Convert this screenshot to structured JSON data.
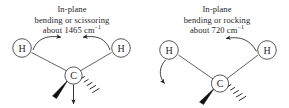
{
  "figure": {
    "background_color": "#ffffff",
    "stroke_color": "#1f1f1f",
    "panels": [
      {
        "id": "scissoring",
        "caption": {
          "line1": "In-plane",
          "line2": "bending or scissoring",
          "line3_prefix": "about 1465 cm",
          "line3_superscript": "−1"
        },
        "atoms": [
          {
            "label": "H",
            "role": "hydrogen-left"
          },
          {
            "label": "H",
            "role": "hydrogen-right"
          },
          {
            "label": "C",
            "role": "carbon-center"
          }
        ],
        "bonds": [
          {
            "from": "C",
            "to": "H-left",
            "style": "plain-line"
          },
          {
            "from": "C",
            "to": "H-right",
            "style": "plain-line"
          },
          {
            "from": "C",
            "to": "substituent-front",
            "style": "bold-wedge"
          },
          {
            "from": "C",
            "to": "substituent-back",
            "style": "hashed-wedge"
          }
        ],
        "motion_arrows": [
          {
            "name": "left-hydrogen-arrow",
            "direction": "curves right, toward center"
          },
          {
            "name": "right-hydrogen-arrow",
            "direction": "curves left, toward center"
          },
          {
            "name": "carbon-recoil-arrow",
            "direction": "straight down"
          }
        ]
      },
      {
        "id": "rocking",
        "caption": {
          "line1": "In-plane",
          "line2": "bending or rocking",
          "line3_prefix": "about 720 cm",
          "line3_superscript": "−1"
        },
        "atoms": [
          {
            "label": "H",
            "role": "hydrogen-left"
          },
          {
            "label": "H",
            "role": "hydrogen-right"
          },
          {
            "label": "C",
            "role": "carbon-center"
          }
        ],
        "bonds": [
          {
            "from": "C",
            "to": "H-left",
            "style": "plain-line"
          },
          {
            "from": "C",
            "to": "H-right",
            "style": "plain-line"
          },
          {
            "from": "C",
            "to": "substituent-front",
            "style": "bold-wedge"
          },
          {
            "from": "C",
            "to": "substituent-back",
            "style": "hashed-wedge"
          }
        ],
        "motion_arrows": [
          {
            "name": "left-hydrogen-arrow",
            "direction": "curves down"
          },
          {
            "name": "right-hydrogen-arrow",
            "direction": "curves up and left"
          }
        ]
      }
    ]
  }
}
